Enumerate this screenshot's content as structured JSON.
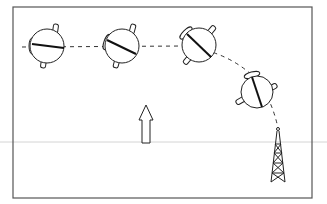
{
  "diagram": {
    "colors": {
      "stroke": "#1a1a1a",
      "frame": "#555555",
      "guide": "#cfcfcf",
      "background": "#ffffff"
    },
    "craft": [
      {
        "id": "craft-1",
        "cx": 47,
        "cy": 46,
        "rotation": 0,
        "needle_angle": 5
      },
      {
        "id": "craft-2",
        "cx": 122,
        "cy": 46,
        "rotation": 0,
        "needle_angle": 22
      },
      {
        "id": "craft-3",
        "cx": 199,
        "cy": 45,
        "rotation": 25,
        "needle_angle": 38
      },
      {
        "id": "craft-4",
        "cx": 257,
        "cy": 92,
        "rotation": 30,
        "needle_angle": 65
      }
    ],
    "arrow": {
      "x": 146,
      "y_top": 105,
      "y_bottom": 143
    },
    "tower": {
      "x": 278,
      "y_top": 128,
      "y_bottom": 182
    }
  }
}
